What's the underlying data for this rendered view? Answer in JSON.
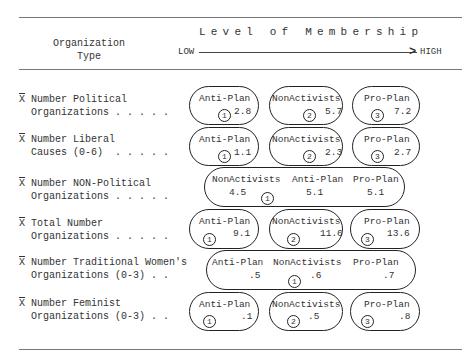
{
  "header": {
    "org_type_line1": "Organization",
    "org_type_line2": "Type",
    "level_title": "Level of Membership",
    "low": "LOW",
    "high": "HIGH"
  },
  "rows": [
    {
      "label1": "Number Political",
      "label2": "  Organizations . . . . .",
      "bar": "X",
      "groups": [
        {
          "name": "Anti-Plan",
          "value": "2.8",
          "rank": "1"
        },
        {
          "name": "NonActivists",
          "value": "5.7",
          "rank": "2"
        },
        {
          "name": "Pro-Plan",
          "value": "7.2",
          "rank": "3"
        }
      ]
    },
    {
      "label1": "Number Liberal",
      "label2": "  Causes (0-6)  . . . . .",
      "bar": "X",
      "groups": [
        {
          "name": "Anti-Plan",
          "value": "1.1",
          "rank": "1"
        },
        {
          "name": "NonActivists",
          "value": "2.3",
          "rank": "2"
        },
        {
          "name": "Pro-Plan",
          "value": "2.7",
          "rank": "3"
        }
      ]
    },
    {
      "label1": "Number NON-Political",
      "label2": "  Organizations . . . . .",
      "bar": "X",
      "groups": [
        {
          "name": "NonActivists",
          "value": "4.5",
          "rank": "1"
        },
        {
          "name": "Anti-Plan",
          "value": "5.1",
          "rank": ""
        },
        {
          "name": "Pro-Plan",
          "value": "5.1",
          "rank": ""
        }
      ]
    },
    {
      "label1": "Total Number",
      "label2": "  Organizations . . . . .",
      "bar": "X",
      "groups": [
        {
          "name": "Anti-Plan",
          "value": "9.1",
          "rank": "1"
        },
        {
          "name": "NonActivists",
          "value": "11.6",
          "rank": "2"
        },
        {
          "name": "Pro-Plan",
          "value": "13.6",
          "rank": "3"
        }
      ]
    },
    {
      "label1": "Number Traditional Women's",
      "label2": "  Organizations (0-3) . .",
      "bar": "X",
      "groups": [
        {
          "name": "Anti-Plan",
          "value": ".5",
          "rank": ""
        },
        {
          "name": "NonActivists",
          "value": ".6",
          "rank": "1"
        },
        {
          "name": "Pro-Plan",
          "value": ".7",
          "rank": ""
        }
      ]
    },
    {
      "label1": "Number Feminist",
      "label2": "  Organizations (0-3) . .",
      "bar": "X",
      "groups": [
        {
          "name": "Anti-Plan",
          "value": ".1",
          "rank": "1"
        },
        {
          "name": "NonActivists",
          "value": ".5",
          "rank": "2"
        },
        {
          "name": "Pro-Plan",
          "value": ".8",
          "rank": "3"
        }
      ]
    }
  ]
}
